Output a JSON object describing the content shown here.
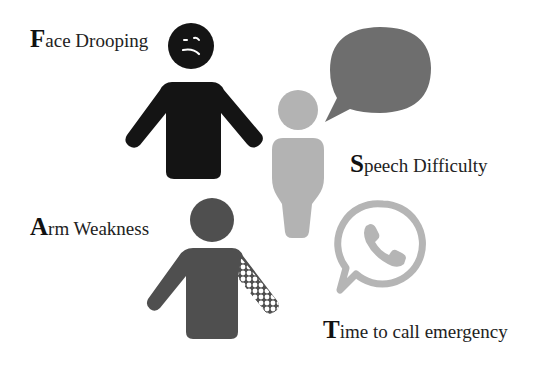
{
  "labels": {
    "face": {
      "initial": "F",
      "rest": "ace Drooping"
    },
    "speech": {
      "initial": "S",
      "rest": "peech Difficulty"
    },
    "arm": {
      "initial": "A",
      "rest": "rm Weakness"
    },
    "time": {
      "initial": "T",
      "rest": "ime to call emergency"
    }
  },
  "figures": {
    "face_person": {
      "icon": "sad-face-person-icon",
      "color": "#141414"
    },
    "speech_person": {
      "icon": "person-icon",
      "color": "#b3b3b3"
    },
    "speech_bubble": {
      "icon": "speech-bubble-icon",
      "color": "#6e6e6e"
    },
    "arm_person": {
      "icon": "weak-arm-person-icon",
      "color": "#4f4f4f"
    },
    "phone": {
      "icon": "phone-chat-icon",
      "color": "#b5b5b5"
    }
  },
  "colors": {
    "background": "#ffffff",
    "text": "#222222"
  }
}
